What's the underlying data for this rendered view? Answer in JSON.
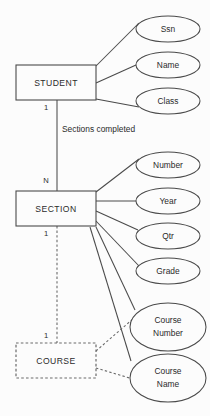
{
  "diagram": {
    "type": "entity-relationship",
    "background_color": "#fcfcfc",
    "line_color": "#4a4a4a",
    "text_color": "#2b2b2b"
  },
  "entities": [
    {
      "id": "student",
      "label": "STUDENT",
      "kind": "strong",
      "x": 16,
      "y": 65,
      "w": 80,
      "h": 35
    },
    {
      "id": "section",
      "label": "SECTION",
      "kind": "strong",
      "x": 16,
      "y": 191,
      "w": 80,
      "h": 35
    },
    {
      "id": "course",
      "label": "COURSE",
      "kind": "weak",
      "x": 16,
      "y": 343,
      "w": 80,
      "h": 35
    }
  ],
  "attributes": [
    {
      "id": "ssn",
      "label": "Ssn",
      "owner": "student",
      "cx": 168,
      "cy": 29,
      "rx": 32,
      "ry": 13
    },
    {
      "id": "name",
      "label": "Name",
      "owner": "student",
      "cx": 168,
      "cy": 65,
      "rx": 32,
      "ry": 13
    },
    {
      "id": "class",
      "label": "Class",
      "owner": "student",
      "cx": 168,
      "cy": 101,
      "rx": 32,
      "ry": 13
    },
    {
      "id": "number",
      "label": "Number",
      "owner": "section",
      "cx": 168,
      "cy": 165,
      "rx": 32,
      "ry": 13
    },
    {
      "id": "year",
      "label": "Year",
      "owner": "section",
      "cx": 168,
      "cy": 201,
      "rx": 32,
      "ry": 13
    },
    {
      "id": "qtr",
      "label": "Qtr",
      "owner": "section",
      "cx": 168,
      "cy": 236,
      "rx": 32,
      "ry": 13
    },
    {
      "id": "grade",
      "label": "Grade",
      "owner": "section",
      "cx": 168,
      "cy": 271,
      "rx": 32,
      "ry": 13
    }
  ],
  "multiline_attributes": [
    {
      "id": "course-number",
      "owner": "course",
      "line1": "Course",
      "line2": "Number",
      "cx": 168,
      "cy": 327,
      "rx": 38,
      "ry": 24
    },
    {
      "id": "course-name",
      "owner": "course",
      "line1": "Course",
      "line2": "Name",
      "cx": 168,
      "cy": 378,
      "rx": 38,
      "ry": 24
    }
  ],
  "relationship": {
    "id": "sections-completed",
    "label": "Sections completed",
    "label_x": 62,
    "label_y": 130,
    "from": "student",
    "to": "section"
  },
  "cardinalities": [
    {
      "id": "student-side",
      "label": "1",
      "x": 46,
      "y": 108
    },
    {
      "id": "section-side",
      "label": "N",
      "x": 46,
      "y": 181
    },
    {
      "id": "section-course-top",
      "label": "1",
      "x": 46,
      "y": 234
    },
    {
      "id": "section-course-bottom",
      "label": "1",
      "x": 46,
      "y": 336
    }
  ]
}
